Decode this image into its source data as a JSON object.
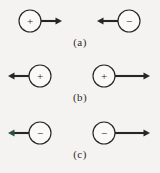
{
  "figure": {
    "type": "physics-force-diagram",
    "background_color": "#f4f3f1",
    "stroke_color": "#262626",
    "circle_fill": "#faf9f7",
    "tinted_arrow_color": "#2f4f42",
    "rows": [
      {
        "label": "(a)",
        "label_id": "label-a",
        "particles": [
          {
            "charge_sign": "+",
            "charge_symbol": "+",
            "cx": 30,
            "cy": 21,
            "r": 11,
            "arrow_direction": "right",
            "arrow_from_x": 41,
            "arrow_to_x": 62,
            "arrow_y": 21,
            "arrow_color": "#262626"
          },
          {
            "charge_sign": "-",
            "charge_symbol": "−",
            "cx": 129,
            "cy": 21,
            "r": 11,
            "arrow_direction": "left",
            "arrow_from_x": 118,
            "arrow_to_x": 97,
            "arrow_y": 21,
            "arrow_color": "#262626"
          }
        ]
      },
      {
        "label": "(b)",
        "label_id": "label-b",
        "particles": [
          {
            "charge_sign": "+",
            "charge_symbol": "+",
            "cx": 40,
            "cy": 76,
            "r": 11,
            "arrow_direction": "left",
            "arrow_from_x": 29,
            "arrow_to_x": 8,
            "arrow_y": 76,
            "arrow_color": "#262626"
          },
          {
            "charge_sign": "+",
            "charge_symbol": "+",
            "cx": 104,
            "cy": 76,
            "r": 11,
            "arrow_direction": "right",
            "arrow_from_x": 115,
            "arrow_to_x": 150,
            "arrow_y": 76,
            "arrow_color": "#262626"
          }
        ]
      },
      {
        "label": "(c)",
        "label_id": "label-c",
        "particles": [
          {
            "charge_sign": "-",
            "charge_symbol": "−",
            "cx": 40,
            "cy": 133,
            "r": 11,
            "arrow_direction": "left",
            "arrow_from_x": 29,
            "arrow_to_x": 8,
            "arrow_y": 133,
            "arrow_color": "#2f4f42"
          },
          {
            "charge_sign": "-",
            "charge_symbol": "−",
            "cx": 104,
            "cy": 133,
            "r": 11,
            "arrow_direction": "right",
            "arrow_from_x": 115,
            "arrow_to_x": 150,
            "arrow_y": 133,
            "arrow_color": "#262626"
          }
        ]
      }
    ]
  }
}
